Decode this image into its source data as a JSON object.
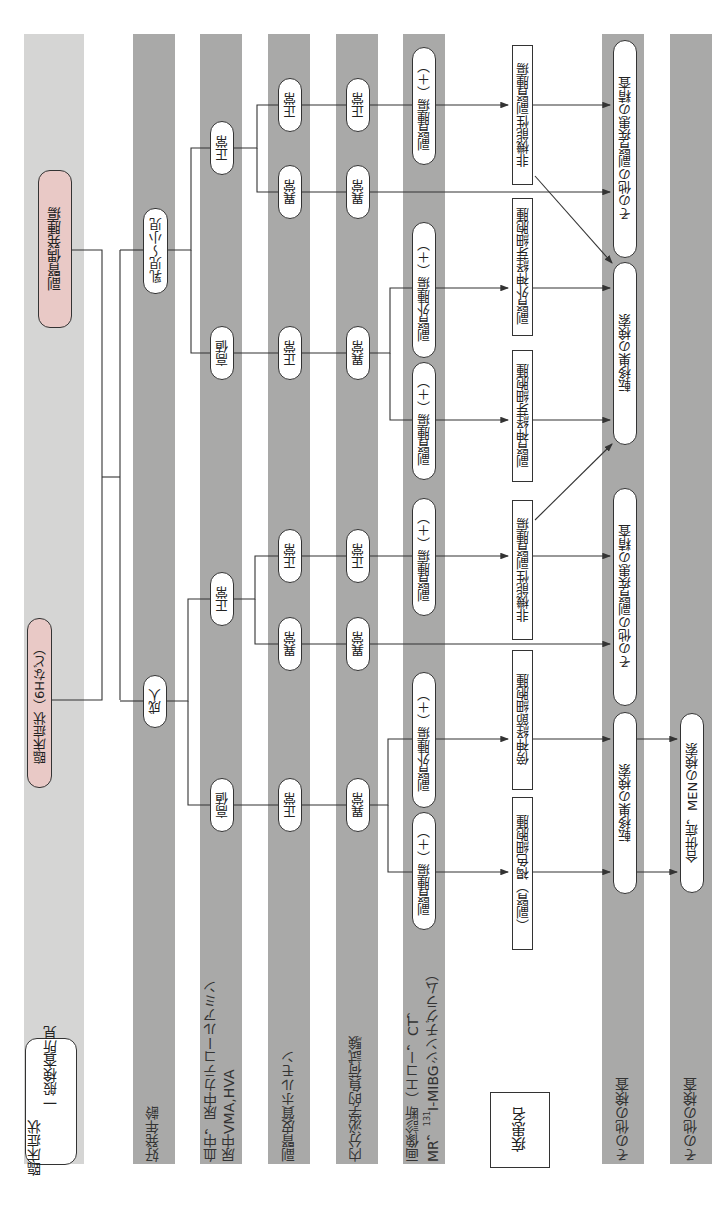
{
  "title_nodes": {
    "incidentaloma": "副腎偶発腫瘍",
    "clinical": "臨床症状（6Hなど）"
  },
  "row_labels": {
    "clinical_findings_line1": "臨床症状",
    "clinical_findings_line2": "一般検査所見",
    "onset_age": "好発年齢",
    "catecholamine_line1": "血中，尿中カテコールアミン",
    "catecholamine_line2": "尿中VMA,HVA",
    "cortical_hormone": "副腎皮質ホルモン",
    "endocrine_load_test": "内分泌学的負荷試験",
    "imaging_line1": "画像診断（エコー，CT，",
    "imaging_line2_prefix": "MR，",
    "imaging_line2_sup": "131",
    "imaging_line2_suffix": "I-MIBGシンチグラム）",
    "disease_name_legend": "疾患名",
    "other_tests_1": "その他の検査",
    "other_tests_2": "その他の検査"
  },
  "child_branch": {
    "age": "乳児〜小児",
    "catechol_normal": "正常",
    "catechol_high": "高値",
    "cortical_normal": "正常",
    "cortical_abnormal": "異常",
    "cortical_normal_high": "正常",
    "load_normal": "正常",
    "load_abnormal": "異常",
    "load_abnormal_high": "異常",
    "img_adrenal_tumor": "副腎腫瘍（＋）",
    "img_extra_adrenal": "副腎外腫瘍（＋）",
    "img_adrenal_tumor_2": "副腎腫瘍（＋）",
    "dx_nonfunctional": "非機能性副腎腫瘍",
    "dx_extra_neuroblastoma": "副腎外神経芽細胞腫",
    "dx_neuroblastoma": "副腎神経芽細胞腫",
    "other_adrenal_workup": "その他の副腎疾患の精査",
    "metastasis_search": "転移巣の検索"
  },
  "adult_branch": {
    "age": "成人",
    "catechol_normal": "正常",
    "catechol_high": "高値",
    "cortical_normal": "正常",
    "cortical_abnormal": "異常",
    "cortical_normal_high": "正常",
    "load_normal": "正常",
    "load_abnormal": "異常",
    "load_abnormal_high": "異常",
    "img_adrenal_tumor": "副腎腫瘍（＋）",
    "img_extra_adrenal": "副腎外腫瘍（＋）",
    "img_adrenal_tumor_2": "副腎腫瘍（＋）",
    "dx_nonfunctional": "非機能性副腎腫瘍",
    "dx_paraganglioma": "傍神経節細胞腫",
    "dx_pheochromocytoma": "（副腎）褐色細胞腫",
    "other_adrenal_workup": "その他の副腎疾患の精査",
    "metastasis_search": "転移巣の検索",
    "complication_men_search": "合併症，MENの検索"
  },
  "colors": {
    "band_light": "#d5d5d4",
    "band_dark": "#a9a9a8",
    "pink_node": "#e9c9c6",
    "line": "#333333"
  }
}
